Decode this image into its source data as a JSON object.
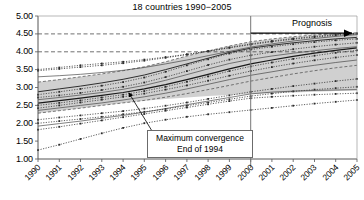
{
  "chart": {
    "title": "18 countries 1990−2005",
    "annotations": {
      "maximum_convergence_line1": "Maximum convergence",
      "maximum_convergence_line2": "End of 1994",
      "prognosis": "Prognosis"
    }
  },
  "chart_data": {
    "type": "line",
    "title": "18 countries 1990−2005",
    "xlabel": "",
    "ylabel": "",
    "x": [
      1990,
      1991,
      1992,
      1993,
      1994,
      1995,
      1996,
      1997,
      1998,
      1999,
      2000,
      2001,
      2002,
      2003,
      2004,
      2005
    ],
    "xtick_labels": [
      "1990",
      "1991",
      "1992",
      "1993",
      "1994",
      "1995",
      "1996",
      "1997",
      "1998",
      "1999",
      "2000",
      "2001",
      "2002",
      "2003",
      "2004",
      "2005"
    ],
    "ylim": [
      1.0,
      5.0
    ],
    "ytick_labels": [
      "1.00",
      "1.50",
      "2.00",
      "2.50",
      "3.00",
      "3.50",
      "4.00",
      "4.50",
      "5.00"
    ],
    "yticks": [
      1.0,
      1.5,
      2.0,
      2.5,
      3.0,
      3.5,
      4.0,
      4.5,
      5.0
    ],
    "grid": "horizontal dashed gridlines at 4.00 and 4.50 only",
    "legend": "none",
    "forecast_divider_x": 2000,
    "shaded_band": {
      "label": "envelope band (grey fill)",
      "upper": [
        3.15,
        3.22,
        3.3,
        3.38,
        3.47,
        3.58,
        3.72,
        3.88,
        4.02,
        4.16,
        4.28,
        4.36,
        4.42,
        4.47,
        4.5,
        4.53
      ],
      "lower": [
        2.28,
        2.35,
        2.42,
        2.5,
        2.57,
        2.63,
        2.68,
        2.72,
        2.76,
        2.79,
        2.82,
        2.84,
        2.86,
        2.88,
        2.9,
        2.92
      ],
      "color": "#d0d0d0"
    },
    "annotations": [
      {
        "text": "Maximum convergence",
        "x": 1994.9,
        "y": 2.1
      },
      {
        "text": "End of 1994",
        "x": 1994.9,
        "y": 1.9
      },
      {
        "text": "Prognosis",
        "x": 2003.2,
        "y": 4.62
      },
      {
        "text": "arrow from 2000 to 2005 at y=4.52",
        "x": 2000,
        "y": 4.52
      }
    ],
    "series": [
      {
        "name": "Country 1",
        "style": "dotted-marker",
        "values": [
          3.5,
          3.56,
          3.62,
          3.67,
          3.72,
          3.78,
          3.85,
          3.93,
          4.02,
          4.12,
          4.22,
          4.3,
          4.37,
          4.43,
          4.48,
          4.52
        ]
      },
      {
        "name": "Country 2",
        "style": "dotted-marker",
        "values": [
          3.47,
          3.52,
          3.57,
          3.62,
          3.68,
          3.75,
          3.83,
          3.92,
          4.01,
          4.11,
          4.2,
          4.28,
          4.35,
          4.41,
          4.46,
          4.5
        ]
      },
      {
        "name": "Country 3",
        "style": "solid-thin",
        "values": [
          3.3,
          3.33,
          3.37,
          3.42,
          3.48,
          3.56,
          3.66,
          3.77,
          3.89,
          4.01,
          4.13,
          4.22,
          4.3,
          4.37,
          4.43,
          4.48
        ]
      },
      {
        "name": "Country 4",
        "style": "dashed-thin",
        "values": [
          3.15,
          3.22,
          3.3,
          3.38,
          3.47,
          3.58,
          3.72,
          3.88,
          4.02,
          4.16,
          4.28,
          4.36,
          4.42,
          4.47,
          4.5,
          4.53
        ]
      },
      {
        "name": "Country 5",
        "style": "solid-medium",
        "values": [
          2.88,
          2.96,
          3.04,
          3.13,
          3.23,
          3.35,
          3.5,
          3.66,
          3.82,
          3.98,
          4.1,
          4.18,
          4.25,
          4.31,
          4.36,
          4.4
        ]
      },
      {
        "name": "Country 6",
        "style": "dotted-marker",
        "values": [
          2.8,
          2.88,
          2.96,
          3.05,
          3.15,
          3.28,
          3.44,
          3.62,
          3.79,
          3.95,
          4.06,
          4.14,
          4.21,
          4.27,
          4.32,
          4.36
        ]
      },
      {
        "name": "Country 7",
        "style": "dotted-marker",
        "values": [
          2.72,
          2.78,
          2.85,
          2.93,
          3.02,
          3.14,
          3.29,
          3.46,
          3.63,
          3.78,
          3.9,
          3.99,
          4.07,
          4.14,
          4.2,
          4.25
        ]
      },
      {
        "name": "Country 8",
        "style": "solid-thin",
        "values": [
          2.66,
          2.72,
          2.79,
          2.86,
          2.95,
          3.06,
          3.2,
          3.36,
          3.52,
          3.67,
          3.79,
          3.88,
          3.96,
          4.03,
          4.09,
          4.14
        ]
      },
      {
        "name": "Country 9",
        "style": "solid-bold",
        "values": [
          2.56,
          2.63,
          2.7,
          2.78,
          2.86,
          2.96,
          3.08,
          3.22,
          3.37,
          3.52,
          3.66,
          3.77,
          3.87,
          3.96,
          4.04,
          4.11
        ]
      },
      {
        "name": "Country 10",
        "style": "dotted-marker",
        "values": [
          2.5,
          2.57,
          2.64,
          2.72,
          2.8,
          2.9,
          3.02,
          3.16,
          3.31,
          3.46,
          3.59,
          3.7,
          3.8,
          3.89,
          3.97,
          4.04
        ]
      },
      {
        "name": "Country 11",
        "style": "dotted-marker",
        "values": [
          2.42,
          2.5,
          2.58,
          2.66,
          2.74,
          2.83,
          2.94,
          3.06,
          3.19,
          3.33,
          3.46,
          3.57,
          3.67,
          3.76,
          3.84,
          3.91
        ]
      },
      {
        "name": "Country 12",
        "style": "solid-thin",
        "values": [
          2.36,
          2.43,
          2.5,
          2.57,
          2.65,
          2.74,
          2.84,
          2.96,
          3.09,
          3.22,
          3.34,
          3.44,
          3.54,
          3.62,
          3.7,
          3.77
        ]
      },
      {
        "name": "Country 13",
        "style": "dashed-thin",
        "values": [
          2.28,
          2.35,
          2.42,
          2.5,
          2.57,
          2.64,
          2.73,
          2.83,
          2.94,
          3.06,
          3.18,
          3.28,
          3.38,
          3.47,
          3.55,
          3.62
        ]
      },
      {
        "name": "Country 14",
        "style": "dotted-marker",
        "values": [
          2.1,
          2.16,
          2.22,
          2.28,
          2.34,
          2.41,
          2.49,
          2.58,
          2.68,
          2.78,
          2.88,
          2.96,
          3.04,
          3.11,
          3.18,
          3.24
        ]
      },
      {
        "name": "Country 15",
        "style": "dotted-marker",
        "values": [
          2.0,
          2.06,
          2.12,
          2.18,
          2.25,
          2.32,
          2.4,
          2.49,
          2.58,
          2.67,
          2.76,
          2.83,
          2.89,
          2.94,
          2.98,
          3.02
        ]
      },
      {
        "name": "Country 16",
        "style": "solid-thin",
        "values": [
          1.92,
          1.99,
          2.06,
          2.14,
          2.22,
          2.31,
          2.41,
          2.52,
          2.62,
          2.72,
          2.82,
          2.87,
          2.9,
          2.92,
          2.93,
          2.94
        ]
      },
      {
        "name": "Country 17",
        "style": "dotted-marker",
        "values": [
          1.82,
          1.9,
          1.99,
          2.08,
          2.17,
          2.26,
          2.35,
          2.44,
          2.53,
          2.62,
          2.7,
          2.74,
          2.77,
          2.8,
          2.82,
          2.84
        ]
      },
      {
        "name": "Country 18",
        "style": "dotted-marker",
        "values": [
          1.25,
          1.4,
          1.56,
          1.72,
          1.87,
          2.0,
          2.1,
          2.18,
          2.25,
          2.31,
          2.37,
          2.43,
          2.49,
          2.55,
          2.6,
          2.65
        ]
      }
    ]
  }
}
